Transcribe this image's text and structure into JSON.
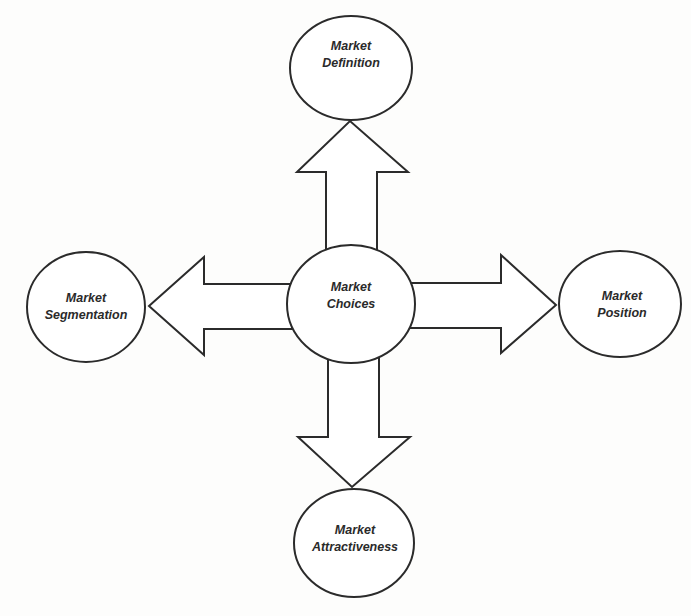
{
  "diagram": {
    "type": "hub-and-spoke",
    "colors": {
      "stroke": "#2b2b2b",
      "fill": "#ffffff",
      "text": "#2a2a2a",
      "background": "#fdfdfc"
    },
    "center": {
      "id": "market-choices",
      "line1": "Market",
      "line2": "Choices"
    },
    "nodes": {
      "top": {
        "id": "market-definition",
        "line1": "Market",
        "line2": "Definition"
      },
      "left": {
        "id": "market-segmentation",
        "line1": "Market",
        "line2": "Segmentation"
      },
      "right": {
        "id": "market-position",
        "line1": "Market",
        "line2": "Position"
      },
      "bottom": {
        "id": "market-attractiveness",
        "line1": "Market",
        "line2": "Attractiveness"
      }
    },
    "edges": [
      {
        "from": "Market Choices",
        "to": "Market Definition",
        "direction": "up"
      },
      {
        "from": "Market Choices",
        "to": "Market Segmentation",
        "direction": "left"
      },
      {
        "from": "Market Choices",
        "to": "Market Position",
        "direction": "right"
      },
      {
        "from": "Market Choices",
        "to": "Market Attractiveness",
        "direction": "down"
      }
    ]
  }
}
